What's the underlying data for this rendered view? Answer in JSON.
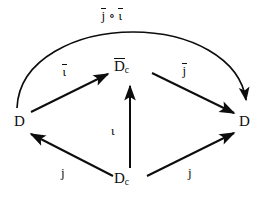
{
  "diagram": {
    "kind": "commutative-diagram",
    "canvas": {
      "width": 266,
      "height": 203
    },
    "ink_color": "#0d0d0d",
    "background_color": "#ffffff",
    "nodes": {
      "d_left": {
        "text": "D",
        "x": 20,
        "y": 122
      },
      "dbar_c": {
        "base": "D",
        "sub": "c",
        "overline": true,
        "text": "D̄c",
        "x": 130,
        "y": 68
      },
      "d_right": {
        "text": "D",
        "x": 245,
        "y": 122
      },
      "dc": {
        "base": "D",
        "sub": "c",
        "overline": false,
        "text": "Dc",
        "x": 130,
        "y": 180
      }
    },
    "edges": [
      {
        "id": "iota-bar",
        "label": "ῑ",
        "label_plain": "iota-bar",
        "from": "d_left",
        "to": "dbar_c",
        "style": "straight",
        "arrowhead": "to"
      },
      {
        "id": "j-bar",
        "label": "ĵ",
        "label_plain": "j-bar",
        "from": "dbar_c",
        "to": "d_right",
        "style": "straight",
        "arrowhead": "to"
      },
      {
        "id": "iota",
        "label": "ι",
        "label_plain": "iota",
        "from": "dc",
        "to": "dbar_c",
        "style": "straight-vertical",
        "arrowhead": "to"
      },
      {
        "id": "j-left",
        "label": "j",
        "label_plain": "j",
        "from": "dc",
        "to": "d_left",
        "style": "straight",
        "arrowhead": "to"
      },
      {
        "id": "j-right",
        "label": "j",
        "label_plain": "j",
        "from": "dc",
        "to": "d_right",
        "style": "straight",
        "arrowhead": "to"
      },
      {
        "id": "composite",
        "label": "ĵ ∘ ῑ",
        "label_plain": "j-bar circ iota-bar",
        "from": "d_left",
        "to": "d_right",
        "style": "curved-arc",
        "arrowhead": "to"
      }
    ]
  },
  "labels": {
    "d_left": "D",
    "d_right": "D",
    "dbar_c_base": "D",
    "dbar_c_sub": "c",
    "dc_base": "D",
    "dc_sub": "c",
    "iota_bar": "ι",
    "j_bar": "j",
    "iota": "ι",
    "j_left": "j",
    "j_right": "j",
    "compose_operator": "∘"
  }
}
